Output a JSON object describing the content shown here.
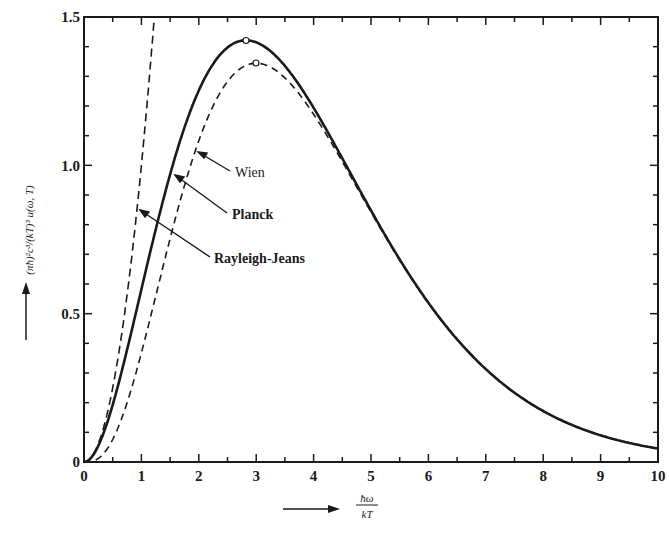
{
  "chart_data": {
    "type": "line",
    "title": "",
    "xlabel": "ħω / kT",
    "ylabel": "(πħ)²c³ / (kT)³ · u(ω, T)",
    "xlim": [
      0,
      10
    ],
    "ylim": [
      0,
      1.5
    ],
    "x_ticks": [
      "0",
      "1",
      "2",
      "3",
      "4",
      "5",
      "6",
      "7",
      "8",
      "9",
      "10"
    ],
    "y_ticks": [
      "0",
      "0.5",
      "1.0",
      "1.5"
    ],
    "grid": false,
    "legend": "inline labels with leader lines",
    "x": [
      0,
      0.25,
      0.5,
      0.75,
      1,
      1.25,
      1.5,
      1.75,
      2,
      2.25,
      2.5,
      2.75,
      3,
      3.25,
      3.5,
      3.75,
      4,
      4.5,
      5,
      5.5,
      6,
      6.5,
      7,
      7.5,
      8,
      8.5,
      9,
      9.5,
      10
    ],
    "series": [
      {
        "name": "Planck",
        "style": "solid",
        "values": [
          0,
          0.055,
          0.191,
          0.379,
          0.582,
          0.776,
          0.944,
          1.079,
          1.252,
          1.284,
          1.362,
          1.406,
          1.419,
          1.41,
          1.381,
          1.337,
          1.281,
          1.146,
          1.004,
          0.86,
          0.724,
          0.6,
          0.49,
          0.395,
          0.315,
          0.25,
          0.196,
          0.153,
          0.045
        ]
      },
      {
        "name": "Wien",
        "style": "dashed",
        "values": [
          0,
          0.012,
          0.076,
          0.199,
          0.368,
          0.56,
          0.753,
          0.931,
          1.083,
          1.2,
          1.282,
          1.328,
          1.344,
          1.334,
          1.302,
          1.254,
          1.194,
          1.054,
          0.842,
          0.679,
          0.535,
          0.413,
          0.313,
          0.234,
          0.172,
          0.125,
          0.09,
          0.064,
          0.045
        ]
      },
      {
        "name": "Rayleigh-Jeans",
        "style": "dashed",
        "values": [
          0,
          0.0625,
          0.25,
          0.5625,
          1.0,
          1.5625,
          null,
          null,
          null,
          null,
          null,
          null,
          null,
          null,
          null,
          null,
          null,
          null,
          null,
          null,
          null,
          null,
          null,
          null,
          null,
          null,
          null,
          null,
          null
        ]
      }
    ],
    "annotations": [
      {
        "text": "Wien",
        "points_to_x": 1.8
      },
      {
        "text": "Planck",
        "points_to_x": 1.55
      },
      {
        "text": "Rayleigh-Jeans",
        "points_to_x": 1.0
      },
      {
        "text": "peak marker (Planck)",
        "x": 2.82,
        "y": 1.421
      },
      {
        "text": "peak marker (Wien)",
        "x": 3.0,
        "y": 1.344
      }
    ]
  },
  "labels": {
    "wien": "Wien",
    "planck": "Planck",
    "rayleigh_jeans": "Rayleigh-Jeans",
    "x_axis_num": "ħω",
    "x_axis_den": "kT",
    "y_axis": "(πħ)²c³/(kT)³ u(ω, T)",
    "y0": "0",
    "y05": "0.5",
    "y10": "1.0",
    "y15": "1.5",
    "x_ticks": [
      "0",
      "1",
      "2",
      "3",
      "4",
      "5",
      "6",
      "7",
      "8",
      "9",
      "10"
    ]
  }
}
